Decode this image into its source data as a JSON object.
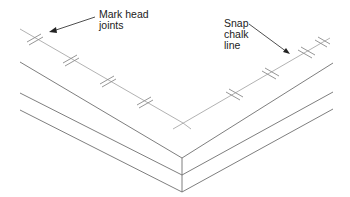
{
  "diagram": {
    "type": "isometric-construction-illustration",
    "labels": {
      "mark_head_joints": "Mark head\njoints",
      "snap_chalk_line": "Snap\nchalk\nline"
    },
    "colors": {
      "edge": "#6f6f6f",
      "chalk_line": "#a9a9a9",
      "joint_mark": "#8a8a8a",
      "leader": "#222222",
      "background": "#ffffff"
    },
    "elements": {
      "chalk_line": "Straight reference line following the plate from the left end to the corner and on to the right end",
      "head_joint_marks": "Double short perpendicular tick marks along the chalk line",
      "left_marks_count": 4,
      "right_marks_count": 4
    }
  }
}
